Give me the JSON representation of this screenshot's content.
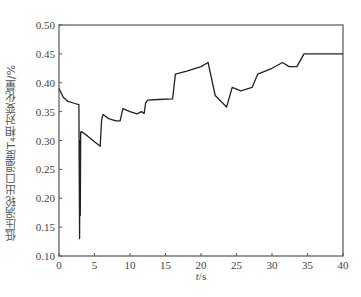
{
  "chart_data": {
    "type": "line",
    "title": "",
    "xlabel": "t/s",
    "ylabel": "低压涡轮出口温度T₄相对变化量/%",
    "xlim": [
      0,
      40
    ],
    "ylim": [
      0.1,
      0.5
    ],
    "x_ticks": [
      "0",
      "5",
      "10",
      "15",
      "20",
      "25",
      "30",
      "35",
      "40"
    ],
    "y_ticks": [
      "0.10",
      "0.15",
      "0.20",
      "0.25",
      "0.30",
      "0.35",
      "0.40",
      "0.45",
      "0.50"
    ],
    "grid": false,
    "legend": null,
    "series": [
      {
        "name": "T4 relative change",
        "color": "#222222",
        "x": [
          0,
          0.2,
          0.6,
          1.2,
          2.0,
          2.8,
          2.85,
          2.9,
          2.95,
          3.0,
          3.05,
          3.1,
          3.2,
          4.0,
          5.0,
          5.8,
          6.0,
          6.2,
          7.0,
          8.0,
          8.6,
          9.0,
          10.0,
          11.0,
          11.6,
          12.0,
          12.2,
          12.5,
          14.0,
          16.0,
          16.4,
          18.0,
          20.0,
          21.0,
          22.0,
          23.6,
          24.4,
          25.6,
          26.2,
          27.2,
          28.0,
          30.0,
          31.5,
          32.4,
          33.5,
          34.5,
          40.0
        ],
        "y": [
          0.39,
          0.385,
          0.375,
          0.368,
          0.365,
          0.362,
          0.25,
          0.13,
          0.3,
          0.17,
          0.315,
          0.313,
          0.315,
          0.308,
          0.298,
          0.29,
          0.335,
          0.345,
          0.338,
          0.334,
          0.334,
          0.355,
          0.35,
          0.346,
          0.35,
          0.347,
          0.365,
          0.37,
          0.371,
          0.372,
          0.415,
          0.42,
          0.428,
          0.435,
          0.378,
          0.358,
          0.392,
          0.386,
          0.388,
          0.392,
          0.415,
          0.425,
          0.435,
          0.428,
          0.428,
          0.45,
          0.45
        ]
      }
    ]
  }
}
